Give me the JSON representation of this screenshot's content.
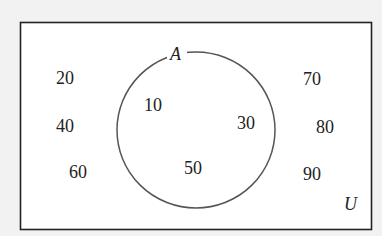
{
  "diagram": {
    "type": "venn",
    "universe_label": "U",
    "sets": [
      {
        "label": "A",
        "elements": [
          "10",
          "30",
          "50"
        ]
      }
    ],
    "outside_elements": [
      "20",
      "40",
      "60",
      "70",
      "80",
      "90"
    ],
    "colors": {
      "background": "#f2f2f2",
      "box_fill": "#ffffff",
      "box_stroke": "#222222",
      "circle_stroke": "#555555",
      "text": "#222222"
    }
  }
}
